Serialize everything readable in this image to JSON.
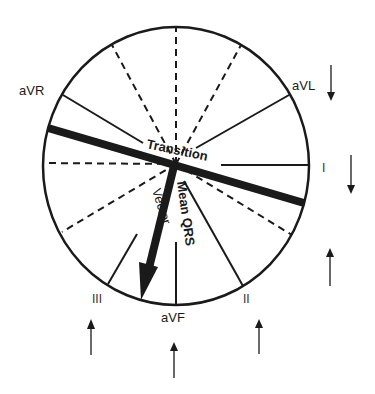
{
  "diagram": {
    "colors": {
      "ink": "#1a1a1a",
      "background": "#ffffff"
    },
    "leads": {
      "aVR": "aVR",
      "aVL": "aVL",
      "I": "I",
      "II": "II",
      "III": "III",
      "aVF": "aVF"
    },
    "annotations": {
      "transition": "Transition",
      "mean_qrs": "Mean QRS",
      "vector": "Vector"
    },
    "deflection_arrows": [
      {
        "lead": "aVL",
        "direction": "down"
      },
      {
        "lead": "I",
        "direction": "down"
      },
      {
        "lead": "right-lower",
        "direction": "up"
      },
      {
        "lead": "III",
        "direction": "up"
      },
      {
        "lead": "aVF",
        "direction": "up"
      },
      {
        "lead": "II",
        "direction": "up"
      }
    ]
  }
}
